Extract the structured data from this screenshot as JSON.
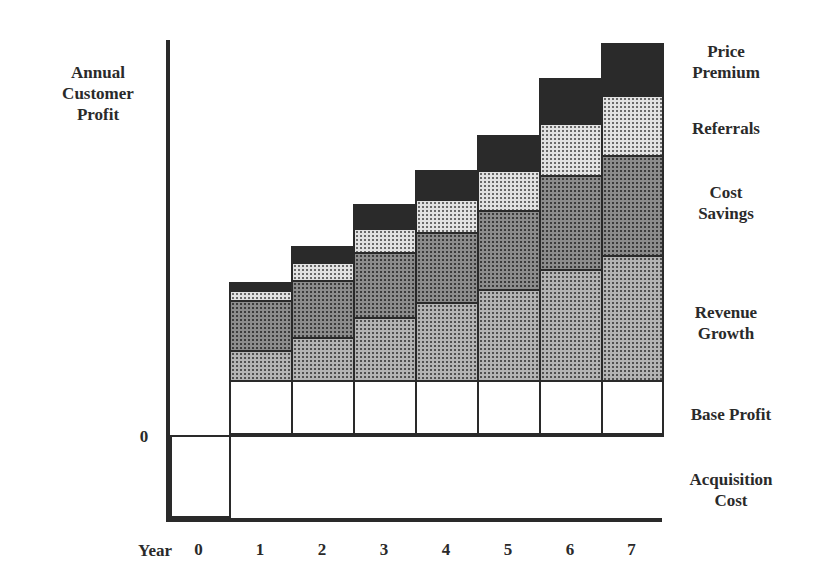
{
  "chart_data": {
    "type": "bar",
    "stacked": true,
    "title": "",
    "ylabel": "Annual Customer Profit",
    "xlabel": "Year",
    "y_zero_label": "0",
    "categories": [
      "0",
      "1",
      "2",
      "3",
      "4",
      "5",
      "6",
      "7"
    ],
    "series": [
      {
        "name": "Acquisition Cost",
        "values": [
          -83,
          0,
          0,
          0,
          0,
          0,
          0,
          0
        ]
      },
      {
        "name": "Base Profit",
        "values": [
          0,
          55,
          55,
          55,
          55,
          55,
          55,
          55
        ]
      },
      {
        "name": "Revenue Growth",
        "values": [
          0,
          30,
          43,
          63,
          78,
          91,
          111,
          125
        ]
      },
      {
        "name": "Cost Savings",
        "values": [
          0,
          50,
          57,
          65,
          70,
          79,
          94,
          100
        ]
      },
      {
        "name": "Referrals",
        "values": [
          0,
          10,
          18,
          24,
          33,
          40,
          52,
          60
        ]
      },
      {
        "name": "Price Premium",
        "values": [
          0,
          8,
          16,
          24,
          29,
          35,
          45,
          52
        ]
      }
    ],
    "units": "relative (no numeric scale shown)",
    "grid": false,
    "legend_position": "right (labels aligned with bar segments)"
  },
  "labels": {
    "y_axis_title_lines": [
      "Annual",
      "Customer",
      "Profit"
    ],
    "zero": "0",
    "x_axis_title": "Year",
    "legend": {
      "price_premium": [
        "Price",
        "Premium"
      ],
      "referrals": "Referrals",
      "cost_savings": [
        "Cost",
        "Savings"
      ],
      "revenue_growth": [
        "Revenue",
        "Growth"
      ],
      "base_profit": "Base Profit",
      "acquisition_cost": [
        "Acquisition",
        "Cost"
      ]
    }
  },
  "colors": {
    "ink": "#2a2a2a",
    "price_premium": "#2a2a2a",
    "referrals": "#e2e2e2",
    "cost_savings": "#8c8c8c",
    "revenue_growth": "#b4b4b4",
    "base_profit": "#ffffff"
  }
}
